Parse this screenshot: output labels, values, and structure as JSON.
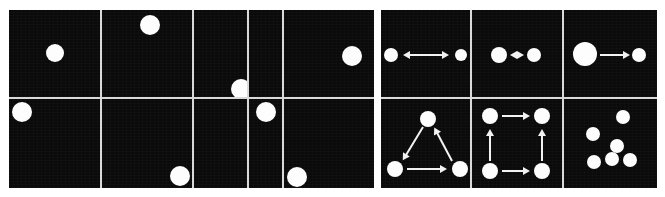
{
  "figure": {
    "background_color": "#ffffff",
    "cell_color": "#0a0a0a",
    "dot_color": "#fdfdfd",
    "gridline_color": "#d9d9d9",
    "arrow_color": "#f2f2f2",
    "width": 665,
    "height": 197
  },
  "panels": [
    {
      "name": "left-panel",
      "label": "static single-dot positions",
      "x": 9,
      "y": 10,
      "width": 365,
      "height": 178,
      "rows": 2,
      "cols": 5,
      "col_edges": [
        0,
        93,
        185,
        240,
        275,
        365
      ],
      "row_edges": [
        0,
        89,
        178
      ],
      "cells": [
        {
          "id": "L-r1c1",
          "row": 1,
          "col": 1,
          "dots": [
            {
              "cx": 46,
              "cy": 43,
              "r": 9
            }
          ],
          "arrows": []
        },
        {
          "id": "L-r1c2",
          "row": 1,
          "col": 2,
          "dots": [
            {
              "cx": 48,
              "cy": 15,
              "r": 10
            }
          ],
          "arrows": []
        },
        {
          "id": "L-r1c3",
          "row": 1,
          "col": 3,
          "dots": [
            {
              "cx": 47,
              "cy": 79,
              "r": 10
            }
          ],
          "arrows": []
        },
        {
          "id": "L-r1c4",
          "row": 1,
          "col": 4,
          "dots": [],
          "arrows": []
        },
        {
          "id": "L-r1c5",
          "row": 1,
          "col": 5,
          "dots": [
            {
              "cx": 68,
              "cy": 46,
              "r": 10
            }
          ],
          "arrows": []
        },
        {
          "id": "L-r2c1",
          "row": 2,
          "col": 1,
          "dots": [
            {
              "cx": 13,
              "cy": 13,
              "r": 10
            }
          ],
          "arrows": []
        },
        {
          "id": "L-r2c2",
          "row": 2,
          "col": 2,
          "dots": [
            {
              "cx": 78,
              "cy": 77,
              "r": 10
            }
          ],
          "arrows": []
        },
        {
          "id": "L-r2c3",
          "row": 2,
          "col": 3,
          "dots": [],
          "arrows": []
        },
        {
          "id": "L-r2c4",
          "row": 2,
          "col": 4,
          "dots": [
            {
              "cx": 17,
              "cy": 13,
              "r": 10
            }
          ],
          "arrows": []
        },
        {
          "id": "L-r2c5",
          "row": 2,
          "col": 5,
          "dots": [
            {
              "cx": 13,
              "cy": 78,
              "r": 10
            }
          ],
          "arrows": []
        }
      ]
    },
    {
      "name": "right-panel",
      "label": "multi-dot configurations with motion arrows",
      "x": 381,
      "y": 10,
      "width": 276,
      "height": 178,
      "rows": 2,
      "cols": 3,
      "col_edges": [
        0,
        91,
        183,
        276
      ],
      "row_edges": [
        0,
        89,
        178
      ],
      "cells": [
        {
          "id": "R-r1c1",
          "row": 1,
          "col": 1,
          "label": "two dots, long bidirectional arrow",
          "dots": [
            {
              "cx": 10,
              "cy": 45,
              "r": 7
            },
            {
              "cx": 80,
              "cy": 45,
              "r": 6
            }
          ],
          "arrows": [
            {
              "x1": 22,
              "y1": 45,
              "x2": 68,
              "y2": 45,
              "head": "both"
            }
          ]
        },
        {
          "id": "R-r1c2",
          "row": 1,
          "col": 2,
          "label": "two dots, short bidirectional arrow",
          "dots": [
            {
              "cx": 27,
              "cy": 45,
              "r": 8
            },
            {
              "cx": 62,
              "cy": 45,
              "r": 7
            }
          ],
          "arrows": [
            {
              "x1": 38,
              "y1": 45,
              "x2": 52,
              "y2": 45,
              "head": "both"
            }
          ]
        },
        {
          "id": "R-r1c3",
          "row": 1,
          "col": 3,
          "label": "large dot and small dot, rightward arrow",
          "dots": [
            {
              "cx": 21,
              "cy": 44,
              "r": 12
            },
            {
              "cx": 75,
              "cy": 45,
              "r": 7
            }
          ],
          "arrows": [
            {
              "x1": 36,
              "y1": 45,
              "x2": 66,
              "y2": 45,
              "head": "right"
            }
          ]
        },
        {
          "id": "R-r2c1",
          "row": 2,
          "col": 1,
          "label": "triangle of three dots, cyclic arrows",
          "dots": [
            {
              "cx": 47,
              "cy": 20,
              "r": 8
            },
            {
              "cx": 14,
              "cy": 70,
              "r": 8
            },
            {
              "cx": 79,
              "cy": 70,
              "r": 8
            }
          ],
          "arrows": [
            {
              "x1": 42,
              "y1": 28,
              "x2": 22,
              "y2": 61,
              "head": "right"
            },
            {
              "x1": 71,
              "y1": 62,
              "x2": 53,
              "y2": 28,
              "head": "right"
            },
            {
              "x1": 26,
              "y1": 70,
              "x2": 66,
              "y2": 70,
              "head": "right"
            }
          ]
        },
        {
          "id": "R-r2c2",
          "row": 2,
          "col": 2,
          "label": "square of four dots, circular arrows",
          "dots": [
            {
              "cx": 18,
              "cy": 17,
              "r": 8
            },
            {
              "cx": 70,
              "cy": 17,
              "r": 8
            },
            {
              "cx": 18,
              "cy": 72,
              "r": 8
            },
            {
              "cx": 70,
              "cy": 72,
              "r": 8
            }
          ],
          "arrows": [
            {
              "x1": 30,
              "y1": 17,
              "x2": 58,
              "y2": 17,
              "head": "right"
            },
            {
              "x1": 30,
              "y1": 72,
              "x2": 58,
              "y2": 72,
              "head": "right"
            },
            {
              "x1": 18,
              "y1": 62,
              "x2": 18,
              "y2": 30,
              "head": "right"
            },
            {
              "x1": 70,
              "y1": 62,
              "x2": 70,
              "y2": 30,
              "head": "right"
            }
          ]
        },
        {
          "id": "R-r2c3",
          "row": 2,
          "col": 3,
          "label": "six scattered dots, no arrows",
          "dots": [
            {
              "cx": 59,
              "cy": 18,
              "r": 7
            },
            {
              "cx": 29,
              "cy": 35,
              "r": 7
            },
            {
              "cx": 53,
              "cy": 47,
              "r": 7
            },
            {
              "cx": 48,
              "cy": 60,
              "r": 7
            },
            {
              "cx": 66,
              "cy": 61,
              "r": 7
            },
            {
              "cx": 30,
              "cy": 63,
              "r": 7
            }
          ],
          "arrows": []
        }
      ]
    }
  ]
}
